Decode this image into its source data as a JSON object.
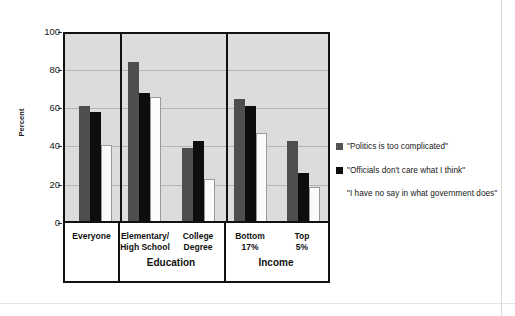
{
  "chart_data": {
    "type": "bar",
    "title": "",
    "xlabel": "",
    "ylabel": "Percent",
    "ylim": [
      0,
      100
    ],
    "yticks": [
      0,
      20,
      40,
      60,
      80,
      100
    ],
    "grid": true,
    "legend_position": "right",
    "categories": [
      "Everyone",
      "Elementary/\nHigh School",
      "College\nDegree",
      "Bottom\n17%",
      "Top\n5%"
    ],
    "category_lines": [
      [
        "Everyone"
      ],
      [
        "Elementary/",
        "High School"
      ],
      [
        "College",
        "Degree"
      ],
      [
        "Bottom",
        "17%"
      ],
      [
        "Top",
        "5%"
      ]
    ],
    "panels": [
      {
        "label": "",
        "categories": [
          "Everyone"
        ]
      },
      {
        "label": "Education",
        "categories": [
          "Elementary/High School",
          "College Degree"
        ]
      },
      {
        "label": "Income",
        "categories": [
          "Bottom 17%",
          "Top 5%"
        ]
      }
    ],
    "series": [
      {
        "name": "\"Politics is too complicated\"",
        "color": "#4e4e4e",
        "values": [
          60,
          83,
          38,
          64,
          42
        ]
      },
      {
        "name": "\"Officials don't care what I think\"",
        "color": "#0d0d0d",
        "values": [
          57,
          67,
          42,
          60,
          25
        ]
      },
      {
        "name": "\"I have no say in what government does\"",
        "color": "#fbfbfb",
        "values": [
          40,
          65,
          22,
          46,
          18
        ]
      }
    ]
  },
  "legend": {
    "items": [
      {
        "swatch": "filled-dark-gray",
        "label": "\"Politics is too complicated\""
      },
      {
        "swatch": "filled-black",
        "label": "\"Officials don't care what I think\""
      },
      {
        "swatch": "none",
        "label": "\"I have no say in what government does\""
      }
    ]
  },
  "axis": {
    "y_title": "Percent",
    "y_tick_labels": [
      "100",
      "80",
      "60",
      "40",
      "20",
      "0"
    ]
  },
  "panel_labels": {
    "education": "Education",
    "income": "Income"
  }
}
